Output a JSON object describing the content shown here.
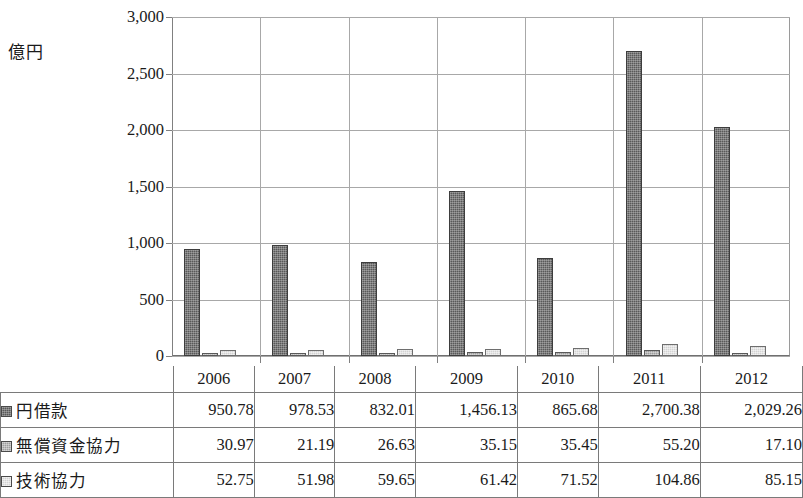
{
  "unit_label": "億円",
  "chart_data": {
    "type": "bar",
    "title": "",
    "subtitle": "",
    "xlabel": "",
    "ylabel": "億円",
    "categories": [
      "2006",
      "2007",
      "2008",
      "2009",
      "2010",
      "2011",
      "2012"
    ],
    "series": [
      {
        "name": "円借款",
        "color": "#595959",
        "values": [
          950.78,
          978.53,
          832.01,
          1456.13,
          865.68,
          2700.38,
          2029.26
        ],
        "labels": [
          "950.78",
          "978.53",
          "832.01",
          "1,456.13",
          "865.68",
          "2,700.38",
          "2,029.26"
        ]
      },
      {
        "name": "無償資金協力",
        "color": "#9d9d9d",
        "values": [
          30.97,
          21.19,
          26.63,
          35.15,
          35.45,
          55.2,
          17.1
        ],
        "labels": [
          "30.97",
          "21.19",
          "26.63",
          "35.15",
          "35.45",
          "55.20",
          "17.10"
        ]
      },
      {
        "name": "技術協力",
        "color": "#d3d3d3",
        "values": [
          52.75,
          51.98,
          59.65,
          61.42,
          71.52,
          104.86,
          85.15
        ],
        "labels": [
          "52.75",
          "51.98",
          "59.65",
          "61.42",
          "71.52",
          "104.86",
          "85.15"
        ]
      }
    ],
    "ylim": [
      0,
      3000
    ],
    "yticks": [
      0,
      500,
      1000,
      1500,
      2000,
      2500,
      3000
    ],
    "ytick_labels": [
      "0",
      "500",
      "1,000",
      "1,500",
      "2,000",
      "2,500",
      "3,000"
    ],
    "grid": true,
    "legend_position": "table-row-labels"
  },
  "table": {
    "corner_label": "",
    "column_headers": [
      "2006",
      "2007",
      "2008",
      "2009",
      "2010",
      "2011",
      "2012"
    ],
    "rows": [
      {
        "label": "円借款",
        "swatch": "dark-gray-square-icon",
        "values": [
          "950.78",
          "978.53",
          "832.01",
          "1,456.13",
          "865.68",
          "2,700.38",
          "2,029.26"
        ]
      },
      {
        "label": "無償資金協力",
        "swatch": "medium-gray-square-icon",
        "values": [
          "30.97",
          "21.19",
          "26.63",
          "35.15",
          "35.45",
          "55.20",
          "17.10"
        ]
      },
      {
        "label": "技術協力",
        "swatch": "light-gray-square-icon",
        "values": [
          "52.75",
          "51.98",
          "59.65",
          "61.42",
          "71.52",
          "104.86",
          "85.15"
        ]
      }
    ]
  }
}
